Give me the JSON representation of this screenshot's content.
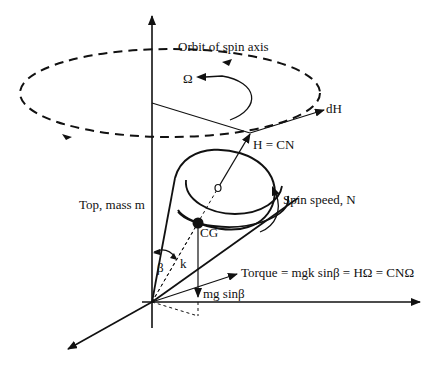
{
  "diagram": {
    "labels": {
      "orbit": "Orbit of spin axis",
      "omega": "Ω",
      "dH": "dH",
      "H": "H = CN",
      "spin": "Spin speed, N",
      "top": "Top, mass m",
      "cg": "CG",
      "beta": "β",
      "k": "k",
      "torque": "Torque = mgk sinβ  =  HΩ  =  CNΩ",
      "weight": "mg sinβ"
    },
    "colors": {
      "ink": "#111111",
      "background": "#ffffff"
    }
  }
}
